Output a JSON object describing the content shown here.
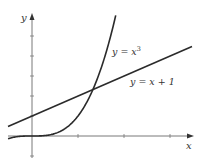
{
  "chart_data": {
    "type": "line",
    "title": "",
    "xlabel": "x",
    "ylabel": "y",
    "xlim": [
      -0.52,
      3.5
    ],
    "ylim": [
      -0.9,
      5.9
    ],
    "x_ticks": [
      1,
      2,
      3
    ],
    "y_ticks": [
      -1,
      1,
      2,
      3,
      4,
      5
    ],
    "tick_labels_shown": false,
    "grid": false,
    "legend": "none (inline curve labels)",
    "series": [
      {
        "name": "y = x^3",
        "label": "y = x",
        "label_sup": "3",
        "expression": "x^3",
        "x": [
          -0.52,
          -0.25,
          0,
          0.25,
          0.5,
          0.75,
          1.0,
          1.25,
          1.5,
          1.82
        ],
        "values": [
          -0.14,
          -0.016,
          0,
          0.016,
          0.125,
          0.42,
          1.0,
          1.95,
          3.375,
          6.03
        ]
      },
      {
        "name": "y = x + 1",
        "label": "y = x + 1",
        "expression": "x + 1",
        "x": [
          -0.52,
          3.48
        ],
        "values": [
          0.48,
          4.48
        ]
      }
    ],
    "annotations": [
      {
        "text": "intersection",
        "x": 1.3247,
        "y": 2.3247
      }
    ]
  },
  "axes": {
    "x_label": "x",
    "y_label": "y"
  },
  "labels": {
    "cubic": {
      "main": "y = x",
      "sup": "3"
    },
    "line": "y = x + 1"
  },
  "colors": {
    "curve": "#2b2b2b",
    "axis": "#555555",
    "background": "#ffffff"
  }
}
